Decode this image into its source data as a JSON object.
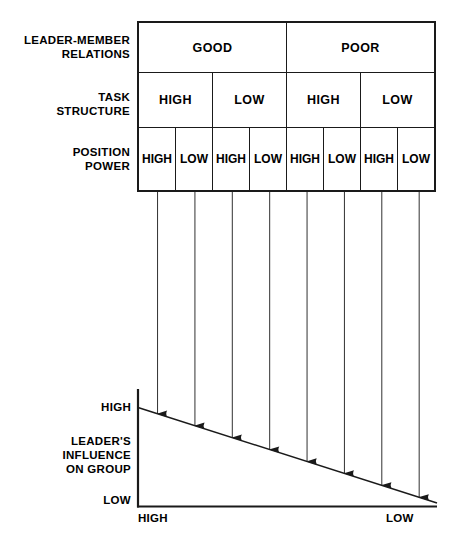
{
  "table": {
    "rows": [
      {
        "label": "LEADER-MEMBER\nRELATIONS",
        "cells": [
          {
            "text": "GOOD",
            "span": 4
          },
          {
            "text": "POOR",
            "span": 4
          }
        ]
      },
      {
        "label": "TASK\nSTRUCTURE",
        "cells": [
          {
            "text": "HIGH",
            "span": 2
          },
          {
            "text": "LOW",
            "span": 2
          },
          {
            "text": "HIGH",
            "span": 2
          },
          {
            "text": "LOW",
            "span": 2
          }
        ]
      },
      {
        "label": "POSITION\nPOWER",
        "cells": [
          {
            "text": "HIGH",
            "span": 1
          },
          {
            "text": "LOW",
            "span": 1
          },
          {
            "text": "HIGH",
            "span": 1
          },
          {
            "text": "LOW",
            "span": 1
          },
          {
            "text": "HIGH",
            "span": 1
          },
          {
            "text": "LOW",
            "span": 1
          },
          {
            "text": "HIGH",
            "span": 1
          },
          {
            "text": "LOW",
            "span": 1
          }
        ]
      }
    ]
  },
  "graph": {
    "y_axis": {
      "top_label": "HIGH",
      "bottom_label": "LOW",
      "title": "LEADER'S\nINFLUENCE\nON GROUP"
    },
    "x_axis": {
      "left_label": "HIGH",
      "right_label": "LOW"
    }
  },
  "chart_data": {
    "type": "line",
    "title": "Leader's Influence on Group",
    "xlabel": "",
    "ylabel": "LEADER'S INFLUENCE ON GROUP",
    "x_tick_labels": [
      "HIGH",
      "LOW"
    ],
    "y_tick_labels": [
      "LOW",
      "HIGH"
    ],
    "xlim": [
      0,
      8
    ],
    "ylim": [
      0,
      1
    ],
    "grid": false,
    "legend": null,
    "categories": [
      "Good / High / High",
      "Good / High / Low",
      "Good / Low / High",
      "Good / Low / Low",
      "Poor / High / High",
      "Poor / High / Low",
      "Poor / Low / High",
      "Poor / Low / Low"
    ],
    "series": [
      {
        "name": "Leader's influence on group",
        "values": [
          1.0,
          0.875,
          0.75,
          0.625,
          0.5,
          0.375,
          0.25,
          0.125
        ]
      }
    ],
    "annotations": [
      "Eight vertical arrows descend from the eight situation columns of the table onto the sloping influence line.",
      "Influence declines monotonically from HIGH at the leftmost situation to LOW at the rightmost situation."
    ],
    "line": {
      "from": [
        0,
        1.0
      ],
      "to": [
        8,
        0.05
      ],
      "style": "solid",
      "color": "#1a1a1a"
    }
  },
  "colors": {
    "ink": "#1a1a1a",
    "background": "#ffffff"
  }
}
